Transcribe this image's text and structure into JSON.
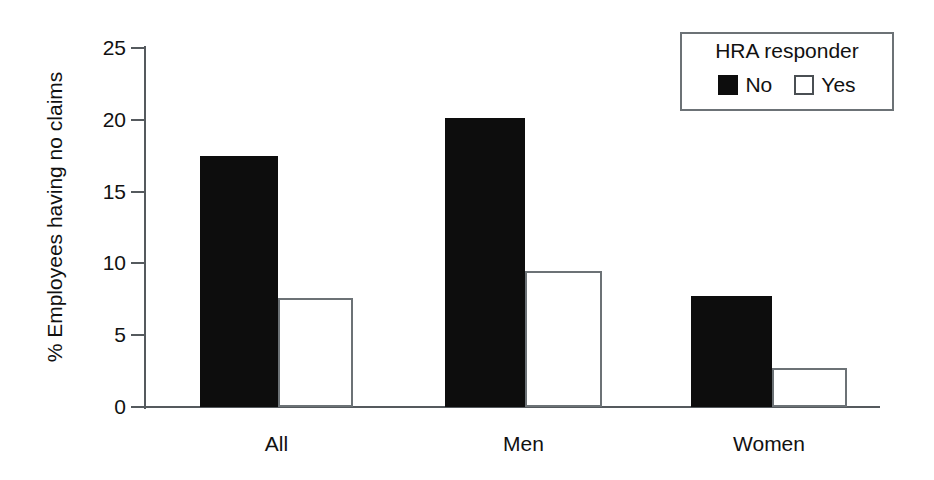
{
  "chart_data": {
    "type": "bar",
    "title": "",
    "xlabel": "",
    "ylabel": "% Employees having no claims",
    "categories": [
      "All",
      "Men",
      "Women"
    ],
    "series": [
      {
        "name": "No",
        "values": [
          17.5,
          20.1,
          7.7
        ],
        "color": "#0d0d0d",
        "style": "filled"
      },
      {
        "name": "Yes",
        "values": [
          7.6,
          9.5,
          2.7
        ],
        "color": "#ffffff",
        "style": "hollow"
      }
    ],
    "ylim": [
      0,
      25
    ],
    "yticks": [
      0,
      5,
      10,
      15,
      20,
      25
    ],
    "ytick_labels": [
      "0",
      "5",
      "10",
      "15",
      "20",
      "25"
    ],
    "grid": false,
    "legend": {
      "position": "top-right",
      "title": "HRA responder",
      "entries": [
        {
          "label": "No",
          "swatch": "filled-square-icon"
        },
        {
          "label": "Yes",
          "swatch": "hollow-square-icon"
        }
      ]
    }
  },
  "axes": {
    "y_title": "% Employees having no claims",
    "tick_labels": [
      "0",
      "5",
      "10",
      "15",
      "20",
      "25"
    ],
    "category_labels": [
      "All",
      "Men",
      "Women"
    ]
  },
  "legend": {
    "title": "HRA responder",
    "no_label": "No",
    "yes_label": "Yes"
  },
  "colors": {
    "bar_no": "#0d0d0d",
    "bar_yes": "#ffffff",
    "bar_yes_border": "#6c7276",
    "axis": "#555a5e",
    "text": "#111111",
    "background": "#ffffff"
  }
}
